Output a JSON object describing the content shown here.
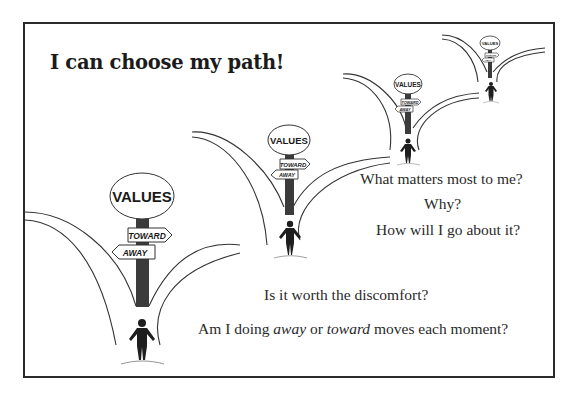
{
  "title": "I can choose my path!",
  "signposts": [
    {
      "values_label": "VALUES",
      "toward_label": "TOWARD",
      "away_label": "AWAY",
      "size": "large"
    },
    {
      "values_label": "VALUES",
      "toward_label": "TOWARD",
      "away_label": "AWAY",
      "size": "medium"
    },
    {
      "values_label": "VALUES",
      "toward_label": "TOWARD",
      "away_label": "AWAY",
      "size": "small"
    },
    {
      "values_label": "VALUES",
      "toward_label": "TOWARD",
      "away_label": "AWAY",
      "size": "tiny"
    }
  ],
  "questions": {
    "q1": "What matters most to me?",
    "q2": "Why?",
    "q3": "How will I go about it?",
    "q4": "Is it worth the discomfort?",
    "q5_prefix": "Am I doing ",
    "q5_away": "away",
    "q5_mid": " or ",
    "q5_toward": "toward",
    "q5_suffix": " moves each moment?"
  },
  "colors": {
    "border": "#2a2a2a",
    "ink": "#222222",
    "post": "#3a3a3a",
    "background": "#ffffff"
  }
}
